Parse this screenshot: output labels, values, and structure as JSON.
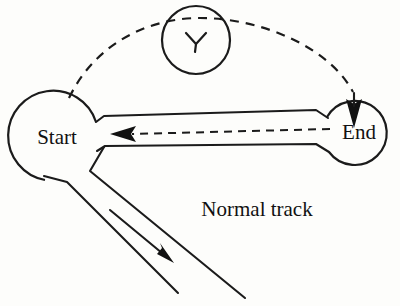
{
  "diagram": {
    "background_color": "#fdfdfb",
    "ink_color": "#1b1b1b",
    "nodes": [
      {
        "id": "start",
        "label": "Start",
        "shape": "circle",
        "cx": 57,
        "cy": 137,
        "r": 45
      },
      {
        "id": "end",
        "label": "End",
        "shape": "circle",
        "cx": 354,
        "cy": 132,
        "r": 32
      },
      {
        "id": "waypoint",
        "label": "",
        "shape": "circle",
        "cx": 196,
        "cy": 40,
        "r": 34
      }
    ],
    "labels": {
      "start": "Start",
      "end": "End",
      "normal_track": "Normal track"
    },
    "edges": [
      {
        "id": "dashed-arc",
        "style": "dashed",
        "from": "start",
        "to": "end",
        "arrow": "down-arrow-into-end",
        "passes_through": "waypoint"
      },
      {
        "id": "dashed-return",
        "style": "dashed",
        "from": "end",
        "to": "start",
        "arrow": "left-arrow-into-start"
      },
      {
        "id": "normal-track-rails",
        "style": "solid-double-rail",
        "from": "start",
        "to": "end"
      },
      {
        "id": "diverging-track-rails",
        "style": "solid-double-rail",
        "from": "start",
        "to": "bottom-right",
        "arrow": "diagonal-arrow-down-right"
      }
    ],
    "arrow_markers": [
      {
        "id": "left-arrow-into-start",
        "direction": "left",
        "tip_x": 110,
        "tip_y": 134
      },
      {
        "id": "down-arrow-into-end",
        "direction": "down",
        "tip_x": 354,
        "tip_y": 128
      },
      {
        "id": "diagonal-arrow-down-right",
        "direction": "down-right",
        "tip_x": 174,
        "tip_y": 263
      },
      {
        "id": "waypoint-chevron",
        "direction": "down",
        "tip_x": 196,
        "tip_y": 46
      }
    ]
  }
}
